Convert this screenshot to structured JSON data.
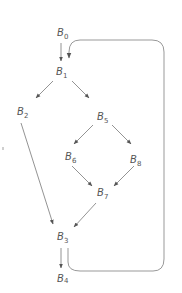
{
  "diagram": {
    "type": "control-flow-graph",
    "nodes": [
      {
        "id": "B0",
        "base": "B",
        "sub": "0",
        "x": 57,
        "y": 36
      },
      {
        "id": "B1",
        "base": "B",
        "sub": "1",
        "x": 56,
        "y": 75
      },
      {
        "id": "B2",
        "base": "B",
        "sub": "2",
        "x": 17,
        "y": 115
      },
      {
        "id": "B5",
        "base": "B",
        "sub": "5",
        "x": 97,
        "y": 120
      },
      {
        "id": "B6",
        "base": "B",
        "sub": "6",
        "x": 65,
        "y": 160
      },
      {
        "id": "B8",
        "base": "B",
        "sub": "8",
        "x": 130,
        "y": 163
      },
      {
        "id": "B7",
        "base": "B",
        "sub": "7",
        "x": 97,
        "y": 188
      },
      {
        "id": "B3",
        "base": "B",
        "sub": "3",
        "x": 57,
        "y": 240
      },
      {
        "id": "B4",
        "base": "B",
        "sub": "4",
        "x": 57,
        "y": 282
      }
    ],
    "edges": [
      {
        "from": "B0",
        "to": "B1"
      },
      {
        "from": "B1",
        "to": "B2"
      },
      {
        "from": "B1",
        "to": "B5"
      },
      {
        "from": "B2",
        "to": "B3"
      },
      {
        "from": "B5",
        "to": "B6"
      },
      {
        "from": "B5",
        "to": "B8"
      },
      {
        "from": "B6",
        "to": "B7"
      },
      {
        "from": "B8",
        "to": "B7"
      },
      {
        "from": "B7",
        "to": "B3"
      },
      {
        "from": "B3",
        "to": "B4"
      },
      {
        "from": "B3",
        "to": "B1",
        "style": "loop-back"
      }
    ],
    "colors": {
      "text": "#555555",
      "edge": "#777777",
      "loop": "#999999",
      "background": "#ffffff"
    }
  }
}
